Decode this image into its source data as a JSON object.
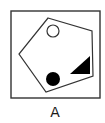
{
  "figure": {
    "label": "A",
    "colors": {
      "stroke": "#333333",
      "fill": "#000000",
      "background": "#ffffff"
    },
    "frame": {
      "x": 11,
      "y": 11,
      "width": 89,
      "height": 87
    },
    "pentagon": {
      "points": "48,18 92,31 93,76 46,92 19,54"
    },
    "shapes": [
      {
        "type": "circle",
        "style": "hollow",
        "cx": 53,
        "cy": 31,
        "r": 6
      },
      {
        "type": "circle",
        "style": "filled",
        "cx": 53,
        "cy": 79,
        "r": 7
      },
      {
        "type": "triangle",
        "style": "filled",
        "points": "70,74 90,74 90,56"
      }
    ]
  }
}
